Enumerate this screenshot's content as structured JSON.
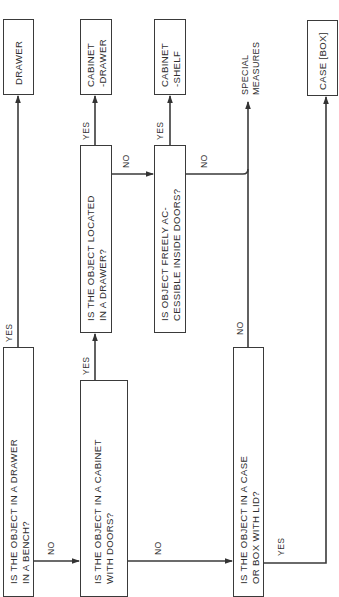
{
  "diagram": {
    "type": "flowchart",
    "orientation": "rotated-90-ccw",
    "questions": {
      "q1": {
        "line1": "IS THE OBJECT IN A DRAWER",
        "line2": "IN A BENCH?"
      },
      "q2": {
        "line1": "IS THE OBJECT IN A CABINET",
        "line2": "WITH DOORS?"
      },
      "q3": {
        "line1": "IS THE OBJECT LOCATED",
        "line2": "IN A DRAWER?"
      },
      "q4": {
        "line1": "IS OBJECT FREELY AC-",
        "line2": "CESSIBLE INSIDE DOORS?"
      },
      "q5": {
        "line1": "IS THE OBJECT IN A CASE",
        "line2": "OR BOX WITH LID?"
      }
    },
    "outcomes": {
      "drawer": {
        "line1": "DRAWER"
      },
      "cabinet_drawer": {
        "line1": "CABINET",
        "line2": "-DRAWER"
      },
      "cabinet_shelf": {
        "line1": "CABINET",
        "line2": "-SHELF"
      },
      "special_measures": {
        "line1": "SPECIAL",
        "line2": "MEASURES"
      },
      "case_box": {
        "line1": "CASE [BOX]"
      }
    },
    "labels": {
      "yes": "YES",
      "no": "NO"
    },
    "colors": {
      "line": "#3a3a3a",
      "text": "#2e2e2e",
      "background": "#ffffff"
    }
  }
}
